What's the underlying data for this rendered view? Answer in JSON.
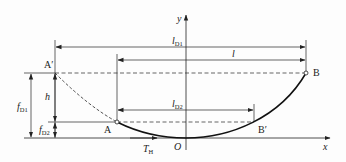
{
  "diagram": {
    "type": "catenary-cable-span",
    "colors": {
      "line": "#222222",
      "background": "#fdfdfd"
    },
    "axes": {
      "x_label": "x",
      "y_label": "y",
      "origin_label": "O"
    },
    "points": {
      "A_prime": "A′",
      "B": "B",
      "A": "A",
      "B_prime": "B′"
    },
    "dimensions": {
      "l_D1": {
        "main": "l",
        "sub": "D1"
      },
      "l": {
        "main": "l",
        "sub": ""
      },
      "l_D2": {
        "main": "l",
        "sub": "D2"
      },
      "f_D1": {
        "main": "f",
        "sub": "D1"
      },
      "h": {
        "main": "h",
        "sub": ""
      },
      "f_D2": {
        "main": "f",
        "sub": "D2"
      }
    },
    "force": {
      "main": "T",
      "sub": "H"
    }
  }
}
